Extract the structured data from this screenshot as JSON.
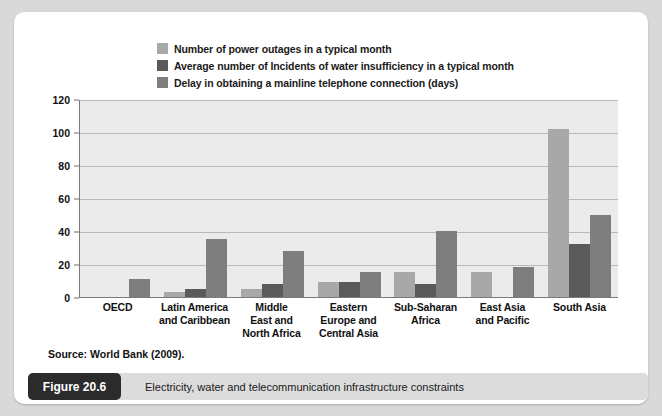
{
  "figure": {
    "badge_label": "Figure 20.6",
    "caption": "Electricity, water and telecommunication infrastructure constraints",
    "source": "Source: World Bank (2009)."
  },
  "colors": {
    "series_power_outages": "#a8a8a8",
    "series_water_insufficiency": "#5a5a5a",
    "series_telephone_delay": "#7e7e7e",
    "plot_background": "#ebebeb",
    "gridline": "#b9b9b9",
    "axis": "#7a7a7a",
    "card_background": "#ffffff",
    "page_background": "#d9d9d9",
    "badge_background": "#2b2b2b",
    "caption_background": "#dcdcdc"
  },
  "chart_data": {
    "type": "bar",
    "title": "",
    "xlabel": "",
    "ylabel": "",
    "ylim": [
      0,
      120
    ],
    "yticks": [
      0,
      20,
      40,
      60,
      80,
      100,
      120
    ],
    "grid": true,
    "legend_position": "top",
    "categories": [
      "OECD",
      "Latin America and Caribbean",
      "Middle East and North Africa",
      "Eastern Europe and Central Asia",
      "Sub-Saharan Africa",
      "East Asia and Pacific",
      "South Asia"
    ],
    "category_lines": [
      [
        "OECD"
      ],
      [
        "Latin America",
        "and Caribbean"
      ],
      [
        "Middle",
        "East and",
        "North Africa"
      ],
      [
        "Eastern",
        "Europe and",
        "Central Asia"
      ],
      [
        "Sub-Saharan",
        "Africa"
      ],
      [
        "East Asia",
        "and Pacific"
      ],
      [
        "South Asia"
      ]
    ],
    "series": [
      {
        "name": "Number of power outages in a typical month",
        "color": "#a8a8a8",
        "values": [
          0,
          3,
          5,
          9,
          15,
          15,
          102
        ]
      },
      {
        "name": "Average number of Incidents of water insufficiency in a typical month",
        "color": "#5a5a5a",
        "values": [
          0,
          5,
          8,
          9,
          8,
          0,
          32
        ]
      },
      {
        "name": "Delay in obtaining a mainline telephone connection (days)",
        "color": "#7e7e7e",
        "values": [
          11,
          35,
          28,
          15,
          40,
          18,
          50
        ]
      }
    ]
  }
}
